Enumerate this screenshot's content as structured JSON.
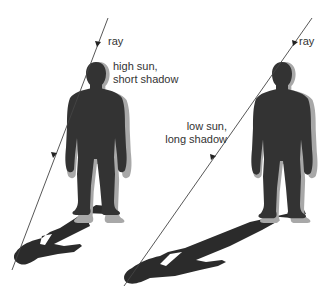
{
  "panels": [
    {
      "id": "high-sun",
      "ray_label": "ray",
      "caption_line1": "high sun,",
      "caption_line2": "short shadow"
    },
    {
      "id": "low-sun",
      "ray_label": "ray",
      "caption_line1": "low sun,",
      "caption_line2": "long shadow"
    }
  ],
  "colors": {
    "figure": "#333333",
    "figure_halo": "#a8a8a8",
    "shadow": "#2b2b2b",
    "ray": "#444444",
    "text": "#333333",
    "background": "#ffffff"
  }
}
